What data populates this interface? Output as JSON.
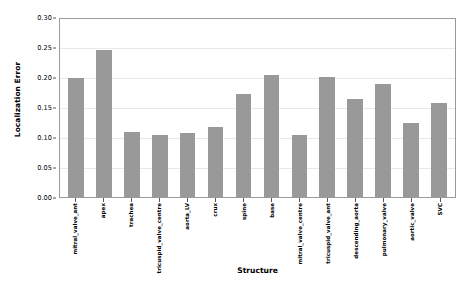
{
  "chart_data": {
    "type": "bar",
    "title": "",
    "xlabel": "Structure",
    "ylabel": "Localization Error",
    "ylim": [
      0.0,
      0.3
    ],
    "ytick_labels": [
      "0.00",
      "0.05",
      "0.10",
      "0.15",
      "0.20",
      "0.25",
      "0.30"
    ],
    "ytick_values": [
      0.0,
      0.05,
      0.1,
      0.15,
      0.2,
      0.25,
      0.3
    ],
    "grid": true,
    "grid_axis": "y",
    "legend": "none",
    "bar_color": "#999999",
    "categories": [
      "mitral_valve_ant",
      "apex",
      "trachea",
      "tricuspid_valve_centre",
      "aorta_LV",
      "crux",
      "spine",
      "base",
      "mitral_valve_centre",
      "tricuspid_valve_ant",
      "descending_aorta",
      "pulmonary_valve",
      "aortic_valve",
      "SVC"
    ],
    "values": [
      0.199,
      0.245,
      0.109,
      0.103,
      0.106,
      0.117,
      0.172,
      0.203,
      0.104,
      0.2,
      0.164,
      0.189,
      0.124,
      0.157
    ]
  }
}
